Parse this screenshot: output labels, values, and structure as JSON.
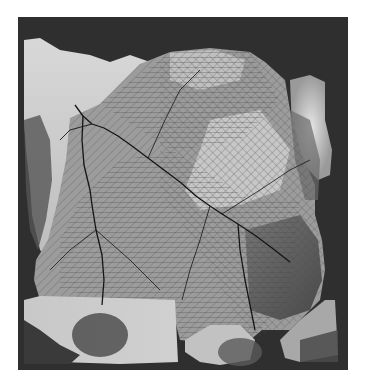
{
  "figure": {
    "frame": {
      "x": 18,
      "y": 17,
      "width": 330,
      "height": 353
    },
    "colors": {
      "background": "#ffffff",
      "border": "#2b2b2b",
      "low_terrain": "#303030",
      "mid_terrain": "#8a8a8a",
      "high_terrain": "#d2d2d2",
      "network_line": "#3a3a3a",
      "main_channel": "#151515"
    },
    "main_channels": [
      {
        "name": "northwest-trunk",
        "points": "75,105 83,116 92,124 104,128 118,136 132,146 148,158 164,170 180,182 196,196 210,206 222,214 238,224 256,236 272,248 290,262"
      },
      {
        "name": "west-trunk",
        "points": "83,116 82,140 84,165 90,190 92,205 96,230 102,255 104,280 102,305"
      },
      {
        "name": "central-south",
        "points": "238,224 240,250 245,280 250,305 255,330"
      },
      {
        "name": "upper-west-spur",
        "points": "92,124 70,130 60,140"
      }
    ]
  }
}
